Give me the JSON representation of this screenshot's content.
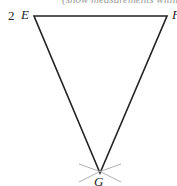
{
  "caption": "(show measurements within the",
  "question_number": "2",
  "vertices": {
    "E": {
      "label": "E",
      "x": 34,
      "y": 16
    },
    "F": {
      "label": "F",
      "x": 167,
      "y": 16
    },
    "G": {
      "label": "G",
      "x": 100,
      "y": 173
    }
  },
  "colors": {
    "line": "#222222",
    "construction_arc": "#b0b0b0",
    "caption": "#9a9a9a"
  }
}
